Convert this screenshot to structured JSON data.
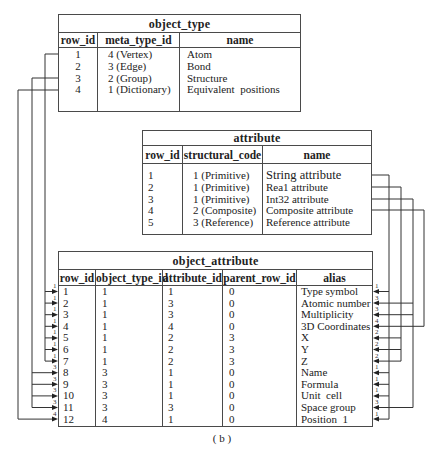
{
  "figure_caption": "( b )",
  "object_type": {
    "title": "object_type",
    "columns": [
      "row_id",
      "meta_type_id",
      "name"
    ],
    "rows": [
      {
        "row_id": "1",
        "meta_type_id": "4 (Vertex)",
        "name": "Atom"
      },
      {
        "row_id": "2",
        "meta_type_id": "3 (Edge)",
        "name": "Bond"
      },
      {
        "row_id": "3",
        "meta_type_id": "2 (Group)",
        "name": "Structure"
      },
      {
        "row_id": "4",
        "meta_type_id": "1 (Dictionary)",
        "name": "Equivalent  positions"
      }
    ]
  },
  "attribute": {
    "title": "attribute",
    "columns": [
      "row_id",
      "structural_code",
      "name"
    ],
    "rows": [
      {
        "row_id": "1",
        "structural_code": "1 (Primitive)",
        "name": "String attribute"
      },
      {
        "row_id": "2",
        "structural_code": "1 (Primitive)",
        "name": "Rea1 attribute"
      },
      {
        "row_id": "3",
        "structural_code": "1 (Primitive)",
        "name": "Int32 attribute"
      },
      {
        "row_id": "4",
        "structural_code": "2 (Composite)",
        "name": "Composite attribute"
      },
      {
        "row_id": "5",
        "structural_code": "3 (Reference)",
        "name": "Reference attribute"
      }
    ]
  },
  "object_attribute": {
    "title": "object_attribute",
    "columns": [
      "row_id",
      "object_type_id",
      "attribute_id",
      "parent_row_id",
      "alias"
    ],
    "rows": [
      {
        "row_id": "1",
        "object_type_id": "1",
        "attribute_id": "1",
        "parent_row_id": "0",
        "alias": "Type symbol"
      },
      {
        "row_id": "2",
        "object_type_id": "1",
        "attribute_id": "3",
        "parent_row_id": "0",
        "alias": "Atomic number"
      },
      {
        "row_id": "3",
        "object_type_id": "1",
        "attribute_id": "3",
        "parent_row_id": "0",
        "alias": "Multiplicity"
      },
      {
        "row_id": "4",
        "object_type_id": "1",
        "attribute_id": "4",
        "parent_row_id": "0",
        "alias": "3D Coordinates"
      },
      {
        "row_id": "5",
        "object_type_id": "1",
        "attribute_id": "2",
        "parent_row_id": "3",
        "alias": "X"
      },
      {
        "row_id": "6",
        "object_type_id": "1",
        "attribute_id": "2",
        "parent_row_id": "3",
        "alias": "Y"
      },
      {
        "row_id": "7",
        "object_type_id": "1",
        "attribute_id": "2",
        "parent_row_id": "3",
        "alias": "Z"
      },
      {
        "row_id": "8",
        "object_type_id": "3",
        "attribute_id": "1",
        "parent_row_id": "0",
        "alias": "Name"
      },
      {
        "row_id": "9",
        "object_type_id": "3",
        "attribute_id": "1",
        "parent_row_id": "0",
        "alias": "Formula"
      },
      {
        "row_id": "10",
        "object_type_id": "3",
        "attribute_id": "1",
        "parent_row_id": "0",
        "alias": "Unit  cell"
      },
      {
        "row_id": "11",
        "object_type_id": "3",
        "attribute_id": "3",
        "parent_row_id": "0",
        "alias": "Space group"
      },
      {
        "row_id": "12",
        "object_type_id": "4",
        "attribute_id": "1",
        "parent_row_id": "0",
        "alias": "Position  1"
      }
    ]
  },
  "connectors": {
    "left_labels": [
      "1",
      "1",
      "1",
      "1",
      "1",
      "1",
      "1",
      "3",
      "3",
      "3",
      "3",
      "4"
    ],
    "right_labels": [
      "1",
      "3",
      "3",
      "4",
      "2",
      "2",
      "2",
      "1",
      "1",
      "1",
      "3",
      "1"
    ]
  }
}
